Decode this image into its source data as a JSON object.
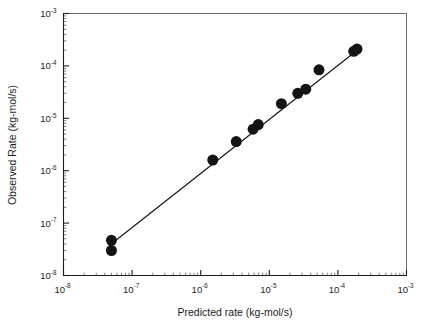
{
  "chart_data": {
    "type": "scatter",
    "title": "",
    "subtitle": "",
    "xlabel": "Predicted rate (kg-mol/s)",
    "ylabel": "Observed Rate (kg-mol/s)",
    "xscale": "log",
    "yscale": "log",
    "xlim": [
      1e-08,
      0.001
    ],
    "ylim": [
      1e-08,
      0.001
    ],
    "grid": false,
    "legend": null,
    "legend_position": "none",
    "x_tick_labels": [
      "10-8",
      "10-7",
      "10-6",
      "10-5",
      "10-4",
      "10-3"
    ],
    "x_tick_bases": [
      "10",
      "10",
      "10",
      "10",
      "10",
      "10"
    ],
    "x_tick_exponents": [
      "-8",
      "-7",
      "-6",
      "-5",
      "-4",
      "-3"
    ],
    "y_tick_labels": [
      "10-8",
      "10-7",
      "10-6",
      "10-5",
      "10-4",
      "10-3"
    ],
    "y_tick_bases": [
      "10",
      "10",
      "10",
      "10",
      "10",
      "10"
    ],
    "y_tick_exponents": [
      "-8",
      "-7",
      "-6",
      "-5",
      "-4",
      "-3"
    ],
    "minor_ticks": true,
    "series": [
      {
        "name": "Observed vs predicted rate",
        "marker": "filled-circle",
        "marker_color": "#141414",
        "marker_size": 11,
        "points": [
          {
            "x": 5e-08,
            "y": 4.7e-08
          },
          {
            "x": 5e-08,
            "y": 3e-08
          },
          {
            "x": 1.5e-06,
            "y": 1.6e-06
          },
          {
            "x": 3.3e-06,
            "y": 3.6e-06
          },
          {
            "x": 5.8e-06,
            "y": 6.2e-06
          },
          {
            "x": 6.9e-06,
            "y": 7.6e-06
          },
          {
            "x": 1.5e-05,
            "y": 1.9e-05
          },
          {
            "x": 2.6e-05,
            "y": 3e-05
          },
          {
            "x": 3.4e-05,
            "y": 3.6e-05
          },
          {
            "x": 5.3e-05,
            "y": 8.4e-05
          },
          {
            "x": 0.00017,
            "y": 0.00019
          },
          {
            "x": 0.00019,
            "y": 0.00021
          }
        ]
      },
      {
        "name": "parity line",
        "type": "line",
        "line_color": "#111111",
        "endpoints": [
          {
            "x": 4.6e-08,
            "y": 3.7e-08
          },
          {
            "x": 0.00021,
            "y": 0.00022
          }
        ]
      }
    ]
  },
  "axes": {
    "x_title": "Predicted rate (kg-mol/s)",
    "y_title": "Observed Rate (kg-mol/s)"
  }
}
